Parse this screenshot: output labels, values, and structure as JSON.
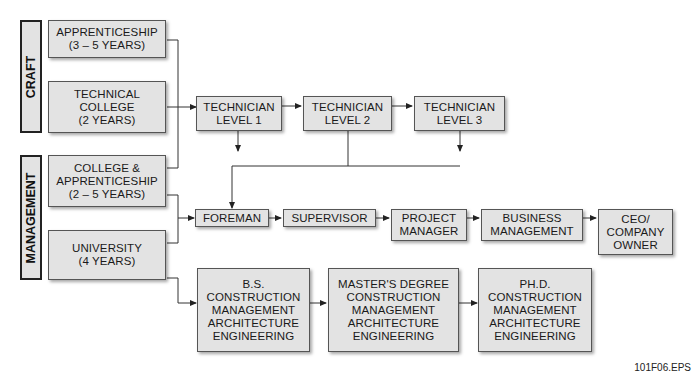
{
  "side_labels": {
    "craft": "CRAFT",
    "management": "MANAGEMENT"
  },
  "entry": {
    "apprenticeship": "APPRENTICESHIP\n(3 – 5 YEARS)",
    "technical_college": "TECHNICAL\nCOLLEGE\n(2 YEARS)",
    "college_apprenticeship": "COLLEGE &\nAPPRENTICESHIP\n(2 – 5 YEARS)",
    "university": "UNIVERSITY\n(4 YEARS)"
  },
  "technician": [
    "TECHNICIAN\nLEVEL 1",
    "TECHNICIAN\nLEVEL 2",
    "TECHNICIAN\nLEVEL 3"
  ],
  "career": [
    "FOREMAN",
    "SUPERVISOR",
    "PROJECT\nMANAGER",
    "BUSINESS\nMANAGEMENT",
    "CEO/\nCOMPANY\nOWNER"
  ],
  "degrees": [
    "B.S.\nCONSTRUCTION\nMANAGEMENT\nARCHITECTURE\nENGINEERING",
    "MASTER'S DEGREE\nCONSTRUCTION\nMANAGEMENT\nARCHITECTURE\nENGINEERING",
    "PH.D.\nCONSTRUCTION\nMANAGEMENT\nARCHITECTURE\nENGINEERING"
  ],
  "figure_label": "101F06.EPS",
  "colors": {
    "box_fill": "#e3e3e3",
    "line": "#333333"
  }
}
